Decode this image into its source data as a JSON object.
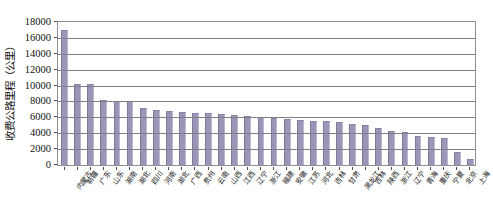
{
  "chart_data": {
    "type": "bar",
    "title": "",
    "xlabel": "",
    "ylabel": "收费公路里程（公里）",
    "ylim": [
      0,
      18000
    ],
    "ytick_labels": [
      "18000",
      "16000",
      "14000",
      "12000",
      "10000",
      "8000",
      "6000",
      "4000",
      "2000",
      "0"
    ],
    "ytick_values": [
      18000,
      16000,
      14000,
      12000,
      10000,
      8000,
      6000,
      4000,
      2000,
      0
    ],
    "grid": true,
    "legend": "none",
    "bar_color": "#9b95b8",
    "bar_edge_color": "#7d7798",
    "axis_color": "#8e8e96",
    "categories": [
      "内蒙古",
      "新疆",
      "广东",
      "山东",
      "湖南",
      "湖北",
      "四川",
      "河南",
      "湖北",
      "广西",
      "贵州",
      "云南",
      "山西",
      "江西",
      "辽宁",
      "浙江",
      "福建",
      "安徽",
      "江苏",
      "河北",
      "吉林",
      "甘肃",
      "黑龙江",
      "吉林",
      "陕西",
      "浙江",
      "辽宁",
      "青海",
      "重庆",
      "宁夏",
      "北京",
      "上海"
    ],
    "values": [
      17000,
      10200,
      10200,
      8200,
      8100,
      8100,
      7200,
      6900,
      6800,
      6700,
      6600,
      6500,
      6400,
      6300,
      6200,
      6000,
      5900,
      5800,
      5700,
      5600,
      5500,
      5400,
      5200,
      5000,
      4700,
      4300,
      4100,
      3700,
      3500,
      3400,
      1600,
      700
    ]
  }
}
